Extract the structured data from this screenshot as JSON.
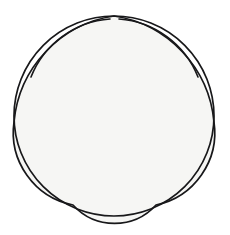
{
  "figure": {
    "type": "geometric-line-drawing",
    "canvas": {
      "width": 230,
      "height": 235
    },
    "background_color": "#ffffff",
    "stroke_color": "#18181a",
    "inner_fill_color": "#f6f6f4",
    "lune_fill_color": "#ffffff",
    "outer_circle": {
      "name": "outer-circle",
      "center_x": 114,
      "center_y": 116,
      "radius": 100,
      "stroke_width": 1.7
    },
    "cusps": [
      {
        "label": "top",
        "x": 114,
        "y": 16
      },
      {
        "label": "right",
        "x": 214,
        "y": 122
      },
      {
        "label": "bottom-right",
        "x": 156,
        "y": 205
      },
      {
        "label": "bottom-left",
        "x": 73,
        "y": 205
      },
      {
        "label": "left",
        "x": 14,
        "y": 122
      }
    ],
    "star_arcs": [
      {
        "label": "top-to-right",
        "from": "top",
        "to": "right",
        "radius": 118,
        "sweep": 1
      },
      {
        "label": "right-to-bottom-right",
        "from": "right",
        "to": "bottom-right",
        "radius": 74,
        "sweep": 1
      },
      {
        "label": "bottom-right-to-bottom-left",
        "from": "bottom-right",
        "to": "bottom-left",
        "radius": 56,
        "sweep": 1
      },
      {
        "label": "bottom-left-to-left",
        "from": "bottom-left",
        "to": "left",
        "radius": 74,
        "sweep": 1
      },
      {
        "label": "left-to-top",
        "from": "left",
        "to": "top",
        "radius": 118,
        "sweep": 1
      }
    ],
    "lune_arcs": [
      {
        "label": "top-left-lune-inner-arc",
        "d": "M 31 77 A 92 92 0 0 1 110 19",
        "stroke_width": 1.6
      },
      {
        "label": "top-right-lune-inner-arc",
        "d": "M 119 19 A 92 92 0 0 1 198 77",
        "stroke_width": 1.6
      }
    ],
    "regions": [
      {
        "label": "central-star",
        "fill": "#f6f6f4"
      },
      {
        "label": "top-left-lune",
        "fill": "#ffffff"
      },
      {
        "label": "top-right-lune",
        "fill": "#ffffff"
      },
      {
        "label": "left-lune",
        "fill": "#ffffff"
      },
      {
        "label": "right-lune",
        "fill": "#ffffff"
      },
      {
        "label": "bottom-lune",
        "fill": "#ffffff"
      }
    ],
    "star_path": "M 114 16 A 118 118 0 0 1 214 122 A 74 74 0 0 1 156 205 A 56 56 0 0 1 73 205 A 74 74 0 0 1 14 122 A 118 118 0 0 1 114 16 Z"
  }
}
